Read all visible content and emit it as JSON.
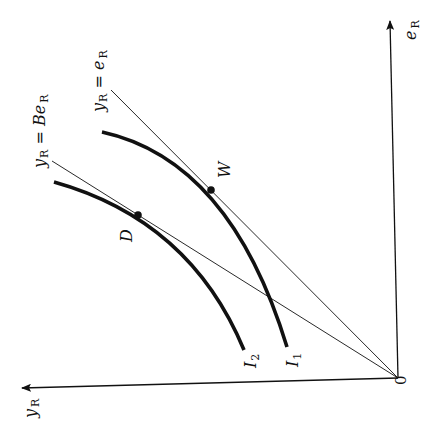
{
  "diagram": {
    "type": "indifference-curve diagram (rotated)",
    "axes": {
      "vertical": {
        "label_main": "e",
        "label_sub": "R"
      },
      "horizontal": {
        "label_main": "y",
        "label_sub": "R"
      },
      "origin": "0"
    },
    "rays": [
      {
        "id": "ray-equal",
        "label_main": "y",
        "label_sub": "R",
        "eq": " = ",
        "rhs_main": "e",
        "rhs_sub": "R"
      },
      {
        "id": "ray-B",
        "label_main": "y",
        "label_sub": "R",
        "eq": " = ",
        "rhs_main": "Be",
        "rhs_sub": "R"
      }
    ],
    "curves": [
      {
        "id": "I1",
        "label_main": "I",
        "label_sub": "1"
      },
      {
        "id": "I2",
        "label_main": "I",
        "label_sub": "2"
      }
    ],
    "points": [
      {
        "id": "W",
        "label": "W"
      },
      {
        "id": "D",
        "label": "D"
      }
    ],
    "colors": {
      "ink": "#111111",
      "background": "#ffffff"
    }
  }
}
